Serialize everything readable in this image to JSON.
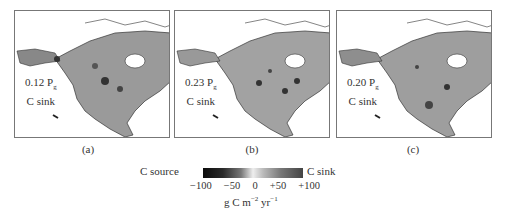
{
  "figure": {
    "panels": [
      {
        "id": "a",
        "label": "(a)",
        "value": "0.12 P",
        "subscript": "g",
        "line2": "C sink"
      },
      {
        "id": "b",
        "label": "(b)",
        "value": "0.23 P",
        "subscript": "g",
        "line2": "C sink"
      },
      {
        "id": "c",
        "label": "(c)",
        "value": "0.20 P",
        "subscript": "g",
        "line2": "C sink"
      }
    ],
    "colorbar": {
      "left_label": "C source",
      "right_label": "C sink",
      "ticks": [
        "−100",
        "−50",
        "0",
        "+50",
        "+100"
      ],
      "units_base": "g C m",
      "units_exp1": "−2",
      "units_mid": " yr",
      "units_exp2": "−1",
      "range": [
        -100,
        100
      ]
    }
  }
}
